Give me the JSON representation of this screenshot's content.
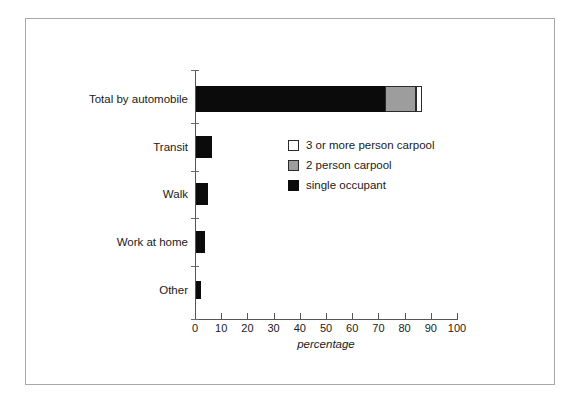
{
  "chart_data": {
    "type": "bar",
    "orientation": "horizontal",
    "stacked": true,
    "title": "",
    "xlabel": "percentage",
    "ylabel": "",
    "xlim": [
      0,
      100
    ],
    "xticks": [
      0,
      10,
      20,
      30,
      40,
      50,
      60,
      70,
      80,
      90,
      100
    ],
    "xtick_labels": [
      "0",
      "10",
      "20",
      "30",
      "40",
      "50",
      "60",
      "70",
      "80",
      "90",
      "100"
    ],
    "grid": false,
    "legend_position": "inside-upper-center",
    "categories": [
      "Total by automobile",
      "Transit",
      "Walk",
      "Work at home",
      "Other"
    ],
    "series": [
      {
        "name": "single occupant",
        "color": "#0b0b0b",
        "values": [
          72.3,
          6.2,
          4.6,
          3.5,
          2.0
        ]
      },
      {
        "name": "2 person carpool",
        "color": "#9d9d9d",
        "values": [
          11.6,
          0,
          0,
          0,
          0
        ]
      },
      {
        "name": "3 or more person carpool",
        "color": "#ffffff",
        "values": [
          2.3,
          0,
          0,
          0,
          0
        ]
      }
    ],
    "totals": [
      86.2,
      6.2,
      4.6,
      3.5,
      2.0
    ]
  },
  "legend": {
    "items": [
      {
        "label": "3 or more person carpool",
        "swatch": "three"
      },
      {
        "label": "2 person carpool",
        "swatch": "two"
      },
      {
        "label": "single occupant",
        "swatch": "single"
      }
    ]
  },
  "axis": {
    "x_title": "percentage"
  },
  "colors": {
    "single_occupant": "#0b0b0b",
    "two_person_carpool": "#9d9d9d",
    "three_or_more_carpool": "#ffffff",
    "axis": "#555555",
    "frame": "#a9a9a9",
    "text": "#1a1a1a"
  }
}
